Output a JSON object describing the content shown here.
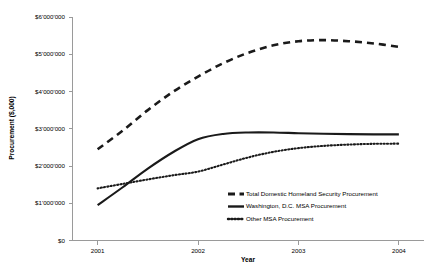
{
  "chart_data": {
    "type": "line",
    "title": "",
    "xlabel": "Year",
    "ylabel": "Procurement ($,000)",
    "x": [
      2001,
      2002,
      2003,
      2004
    ],
    "xlim": [
      2000.75,
      2004.25
    ],
    "ylim": [
      0,
      6000000
    ],
    "grid": false,
    "legend_position": "inside-bottom-right",
    "y_ticks": [
      0,
      1000000,
      2000000,
      3000000,
      4000000,
      5000000,
      6000000
    ],
    "y_tick_labels": [
      "$0",
      "$1'000'000",
      "$2'000'000",
      "$3'000'000",
      "$4'000'000",
      "$5'000'000",
      "$6'000'000"
    ],
    "x_tick_labels": [
      "2001",
      "2002",
      "2003",
      "2004"
    ],
    "series": [
      {
        "name": "Total Domestic Homeland Security Procurement",
        "style": "dashed",
        "color": "#1a1a1a",
        "values": [
          2450000,
          4400000,
          5350000,
          5200000
        ],
        "dense_x": [
          2001,
          2001.25,
          2001.5,
          2001.75,
          2002,
          2002.25,
          2002.5,
          2002.75,
          2003,
          2003.25,
          2003.5,
          2003.75,
          2004
        ],
        "dense_y": [
          2450000,
          2950000,
          3500000,
          3990000,
          4400000,
          4760000,
          5040000,
          5240000,
          5350000,
          5380000,
          5350000,
          5290000,
          5200000
        ]
      },
      {
        "name": "Washington, D.C. MSA Procurement",
        "style": "solid",
        "color": "#1a1a1a",
        "values": [
          950000,
          2720000,
          2880000,
          2850000
        ],
        "dense_x": [
          2001,
          2001.25,
          2001.5,
          2001.75,
          2002,
          2002.25,
          2002.5,
          2002.75,
          2003,
          2003.25,
          2003.5,
          2003.75,
          2004
        ],
        "dense_y": [
          950000,
          1430000,
          1930000,
          2370000,
          2720000,
          2860000,
          2900000,
          2900000,
          2880000,
          2865000,
          2855000,
          2850000,
          2850000
        ]
      },
      {
        "name": "Other MSA Procurement",
        "style": "dotted",
        "color": "#1a1a1a",
        "values": [
          1400000,
          1850000,
          2480000,
          2600000
        ],
        "dense_x": [
          2001,
          2001.25,
          2001.5,
          2001.75,
          2002,
          2002.25,
          2002.5,
          2002.75,
          2003,
          2003.25,
          2003.5,
          2003.75,
          2004
        ],
        "dense_y": [
          1400000,
          1520000,
          1640000,
          1750000,
          1850000,
          2040000,
          2230000,
          2380000,
          2480000,
          2540000,
          2575000,
          2595000,
          2600000
        ]
      }
    ]
  },
  "legend": {
    "entries": [
      "Total Domestic Homeland Security Procurement",
      "Washington, D.C. MSA Procurement",
      "Other MSA Procurement"
    ]
  }
}
